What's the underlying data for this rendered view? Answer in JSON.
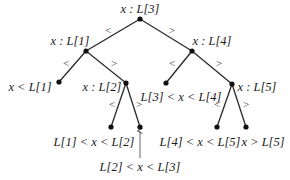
{
  "diagram": {
    "nodes": {
      "root": {
        "label": "x : L[3]"
      },
      "l1": {
        "label": "x : L[1]"
      },
      "l4": {
        "label": "x : L[4]"
      },
      "l2": {
        "label": "x : L[2]"
      },
      "l5": {
        "label": "x : L[5]"
      }
    },
    "leaves": {
      "lt_l1": "x < L[1]",
      "l1_l2": "L[1] < x < L[2]",
      "l2_l3": "L[2] < x < L[3]",
      "l3_l4": "L[3] < x < L[4]",
      "l4_l5": "L[4] < x < L[5]",
      "gt_l5": "x > L[5]"
    },
    "edge_labels": {
      "less": "<",
      "greater": ">"
    }
  }
}
